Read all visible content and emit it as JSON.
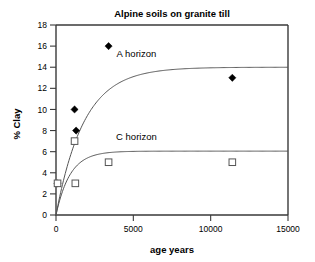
{
  "chart_data": {
    "type": "scatter",
    "title": "Alpine soils on granite till",
    "xlabel": "age years",
    "ylabel": "% Clay",
    "xlim": [
      0,
      15000
    ],
    "ylim": [
      0,
      18
    ],
    "xticks": [
      0,
      5000,
      10000,
      15000
    ],
    "yticks": [
      0,
      2,
      4,
      6,
      8,
      10,
      12,
      14,
      16,
      18
    ],
    "xtick_labels": [
      "0",
      "5000",
      "10000",
      "15000"
    ],
    "ytick_labels": [
      "0",
      "2",
      "4",
      "6",
      "8",
      "10",
      "12",
      "14",
      "16",
      "18"
    ],
    "grid": false,
    "legend": "inline-annotation",
    "annotations": [
      {
        "text": "A horizon",
        "x": 5200,
        "y": 15.0
      },
      {
        "text": "C horizon",
        "x": 5200,
        "y": 7.1
      }
    ],
    "series": [
      {
        "name": "A horizon",
        "marker": "filled-diamond",
        "color": "#000000",
        "points": [
          {
            "x": 100,
            "y": 3.0
          },
          {
            "x": 1200,
            "y": 10.0
          },
          {
            "x": 1300,
            "y": 8.0
          },
          {
            "x": 3400,
            "y": 16.0
          },
          {
            "x": 11400,
            "y": 13.0
          }
        ],
        "fit_plateau": 14.0,
        "fit_rate": 0.00055
      },
      {
        "name": "C horizon",
        "marker": "open-square",
        "color": "#555555",
        "points": [
          {
            "x": 100,
            "y": 3.0
          },
          {
            "x": 1200,
            "y": 7.0
          },
          {
            "x": 1250,
            "y": 3.0
          },
          {
            "x": 3400,
            "y": 5.0
          },
          {
            "x": 11400,
            "y": 5.0
          }
        ],
        "fit_plateau": 6.05,
        "fit_rate": 0.0011
      }
    ]
  }
}
